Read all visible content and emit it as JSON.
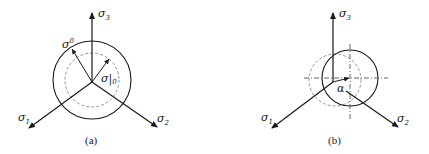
{
  "panels": [
    {
      "id": "a",
      "caption": "(a)",
      "axes": {
        "sigma1": "σ",
        "sigma1_sub": "1",
        "sigma2": "σ",
        "sigma2_sub": "2",
        "sigma3": "σ",
        "sigma3_sub": "3"
      },
      "labels": {
        "sigma_zero": "σ",
        "sigma_zero_sup": "0",
        "sigma_bar": "σ|",
        "sigma_bar_sub": "0"
      }
    },
    {
      "id": "b",
      "caption": "(b)",
      "axes": {
        "sigma1": "σ",
        "sigma1_sub": "1",
        "sigma2": "σ",
        "sigma2_sub": "2",
        "sigma3": "σ",
        "sigma3_sub": "3"
      },
      "labels": {
        "alpha": "α"
      }
    }
  ],
  "colors": {
    "stroke": "#1a1a1a",
    "dashed": "#888888"
  }
}
